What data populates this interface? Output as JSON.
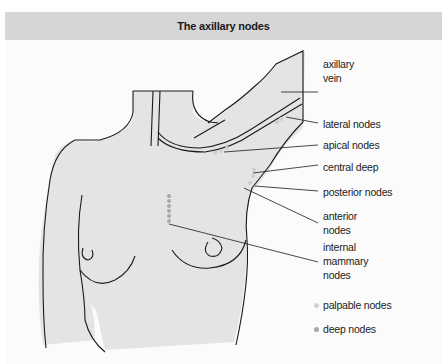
{
  "title": "The axillary nodes",
  "labels": {
    "axillary_vein": [
      "axillary",
      "vein"
    ],
    "lateral_nodes": "lateral nodes",
    "apical_nodes": "apical nodes",
    "central_deep": "central deep",
    "posterior_nodes": "posterior nodes",
    "anterior_nodes": [
      "anterior",
      "nodes"
    ],
    "internal_mammary_nodes": [
      "internal",
      "mammary",
      "nodes"
    ]
  },
  "legend": [
    {
      "label": "palpable nodes",
      "color": "#d0d0d0"
    },
    {
      "label": "deep nodes",
      "color": "#a8a8a8"
    }
  ],
  "colors": {
    "header_bg": "#d6d6d6",
    "body_fill": "#e4e4e4",
    "outline": "#1a1a1a"
  }
}
